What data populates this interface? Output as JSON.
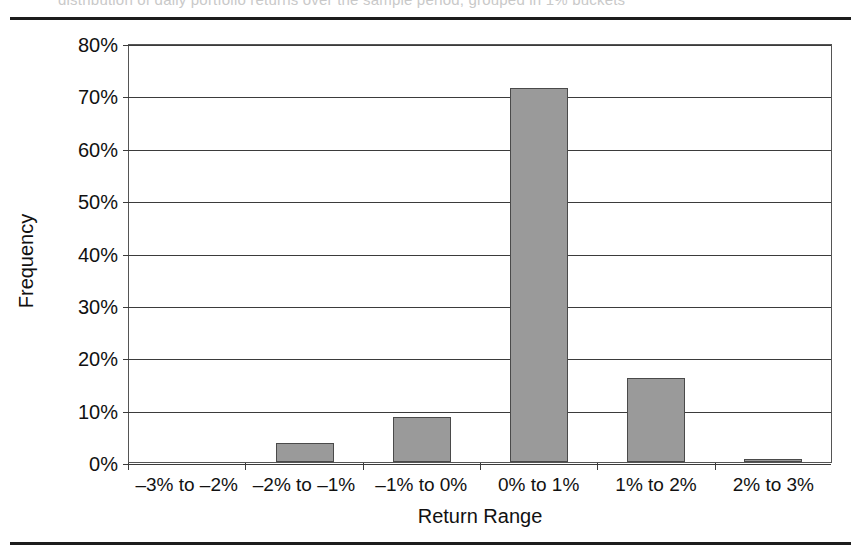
{
  "figure": {
    "caption_sliver": "distribution of daily portfolio returns over the sample period, grouped in 1% buckets"
  },
  "chart_data": {
    "type": "bar",
    "title": "",
    "subtitle": "",
    "xlabel": "Return Range",
    "ylabel": "Frequency",
    "categories": [
      "–3% to –2%",
      "–2% to –1%",
      "–1% to 0%",
      "0% to 1%",
      "1% to 2%",
      "2% to 3%"
    ],
    "values": [
      0.0,
      3.7,
      8.5,
      71.4,
      16.1,
      0.6
    ],
    "value_labels": [
      "0%",
      "3.7%",
      "8.5%",
      "71.4%",
      "16.1%",
      "0.6%"
    ],
    "ylim": [
      0,
      80
    ],
    "ytick_values": [
      0,
      10,
      20,
      30,
      40,
      50,
      60,
      70,
      80
    ],
    "ytick_labels": [
      "0%",
      "10%",
      "20%",
      "30%",
      "40%",
      "50%",
      "60%",
      "70%",
      "80%"
    ],
    "grid": "horizontal",
    "legend": "none",
    "colors": {
      "bar_fill": "#9a9a9a",
      "bar_stroke": "#4a4a4a",
      "gridline": "#3b3b3b",
      "axis": "#555555",
      "text": "#111111",
      "rule": "#1d1d1d",
      "background": "#ffffff"
    }
  }
}
